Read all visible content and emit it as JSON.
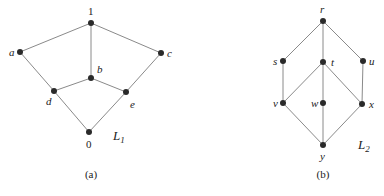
{
  "figures": [
    {
      "id": "L1",
      "name": "L",
      "subscript": "1",
      "caption": "(a)",
      "name_pos": [
        113,
        140
      ],
      "caption_pos": [
        91,
        178
      ],
      "nodes": [
        {
          "id": "1",
          "label": "1",
          "x": 91,
          "y": 23,
          "lx": 88,
          "ly": 15,
          "italic": false
        },
        {
          "id": "a",
          "label": "a",
          "x": 20,
          "y": 52,
          "lx": 9,
          "ly": 56,
          "italic": true
        },
        {
          "id": "c",
          "label": "c",
          "x": 161,
          "y": 53,
          "lx": 167,
          "ly": 57,
          "italic": true
        },
        {
          "id": "b",
          "label": "b",
          "x": 91,
          "y": 78,
          "lx": 97,
          "ly": 73,
          "italic": true
        },
        {
          "id": "d",
          "label": "d",
          "x": 54,
          "y": 91,
          "lx": 46,
          "ly": 105,
          "italic": true
        },
        {
          "id": "e",
          "label": "e",
          "x": 126,
          "y": 92,
          "lx": 130,
          "ly": 108,
          "italic": true
        },
        {
          "id": "0",
          "label": "0",
          "x": 89,
          "y": 132,
          "lx": 86,
          "ly": 148,
          "italic": false
        }
      ],
      "edges": [
        [
          "1",
          "a"
        ],
        [
          "1",
          "c"
        ],
        [
          "1",
          "b"
        ],
        [
          "a",
          "d"
        ],
        [
          "c",
          "e"
        ],
        [
          "b",
          "d"
        ],
        [
          "b",
          "e"
        ],
        [
          "d",
          "0"
        ],
        [
          "e",
          "0"
        ]
      ]
    },
    {
      "id": "L2",
      "name": "L",
      "subscript": "2",
      "caption": "(b)",
      "name_pos": [
        358,
        149
      ],
      "caption_pos": [
        323,
        178
      ],
      "nodes": [
        {
          "id": "r",
          "label": "r",
          "x": 323,
          "y": 21,
          "lx": 320,
          "ly": 13,
          "italic": true
        },
        {
          "id": "s",
          "label": "s",
          "x": 283,
          "y": 61,
          "lx": 273,
          "ly": 65,
          "italic": true
        },
        {
          "id": "t",
          "label": "t",
          "x": 323,
          "y": 62,
          "lx": 331,
          "ly": 66,
          "italic": true
        },
        {
          "id": "u",
          "label": "u",
          "x": 363,
          "y": 61,
          "lx": 369,
          "ly": 65,
          "italic": true
        },
        {
          "id": "v",
          "label": "v",
          "x": 283,
          "y": 103,
          "lx": 273,
          "ly": 107,
          "italic": true
        },
        {
          "id": "w",
          "label": "w",
          "x": 323,
          "y": 103,
          "lx": 311,
          "ly": 107,
          "italic": true
        },
        {
          "id": "x",
          "label": "x",
          "x": 362,
          "y": 104,
          "lx": 369,
          "ly": 108,
          "italic": true
        },
        {
          "id": "y",
          "label": "y",
          "x": 323,
          "y": 145,
          "lx": 320,
          "ly": 160,
          "italic": true
        }
      ],
      "edges": [
        [
          "r",
          "s"
        ],
        [
          "r",
          "t"
        ],
        [
          "r",
          "u"
        ],
        [
          "s",
          "v"
        ],
        [
          "u",
          "x"
        ],
        [
          "t",
          "v"
        ],
        [
          "t",
          "w"
        ],
        [
          "t",
          "x"
        ],
        [
          "v",
          "y"
        ],
        [
          "w",
          "y"
        ],
        [
          "x",
          "y"
        ]
      ]
    }
  ],
  "colors": {
    "edge": "#8a8a8a",
    "node": "#2a2a2a",
    "text": "#222222"
  }
}
